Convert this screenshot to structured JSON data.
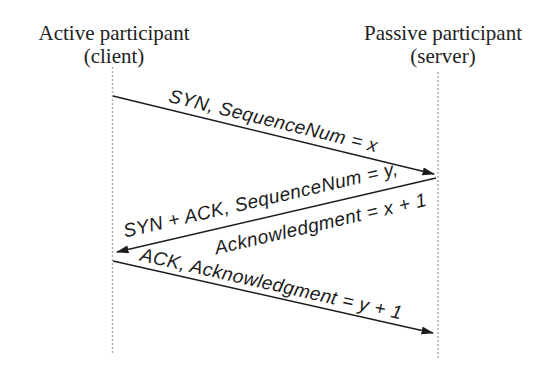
{
  "participants": {
    "client": {
      "name": "Active participant",
      "role": "(client)"
    },
    "server": {
      "name": "Passive participant",
      "role": "(server)"
    }
  },
  "messages": [
    {
      "from": "client",
      "to": "server",
      "label": "SYN, SequenceNum = x"
    },
    {
      "from": "server",
      "to": "client",
      "label_line1": "SYN + ACK, SequenceNum = y,",
      "label_line2": "Acknowledgment = x + 1"
    },
    {
      "from": "client",
      "to": "server",
      "label": "ACK, Acknowledgment = y + 1"
    }
  ],
  "colors": {
    "ink": "#1c1c1c",
    "lifeline": "#a9a9a9",
    "background": "#ffffff"
  }
}
